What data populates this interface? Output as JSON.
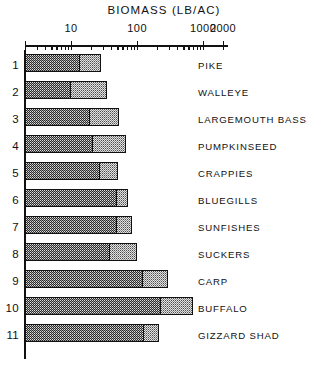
{
  "chart_data": {
    "type": "bar",
    "title": "BIOMASS (LB/AC)",
    "xlabel": "BIOMASS (LB/AC)",
    "ylabel": "",
    "orientation": "horizontal",
    "xscale": "log",
    "xlim": [
      2,
      2000
    ],
    "grid": false,
    "legend": null,
    "tick_labels": [
      "10",
      "100",
      "1000",
      "2000"
    ],
    "tick_values": [
      10,
      100,
      1000,
      2000
    ],
    "minor_tick_values": [
      3,
      4,
      5,
      6,
      7,
      8,
      9,
      20,
      30,
      40,
      50,
      60,
      70,
      80,
      90,
      200,
      300,
      400,
      500,
      600,
      700,
      800,
      900
    ],
    "categories": [
      "PIKE",
      "WALLEYE",
      "LARGEMOUTH BASS",
      "PUMPKINSEED",
      "CRAPPIES",
      "BLUEGILLS",
      "SUNFISHES",
      "SUCKERS",
      "CARP",
      "BUFFALO",
      "GIZZARD SHAD"
    ],
    "row_numbers": [
      "1",
      "2",
      "3",
      "4",
      "5",
      "6",
      "7",
      "8",
      "9",
      "10",
      "11"
    ],
    "series": [
      {
        "name": "low-range",
        "values": [
          6,
          4.3,
          8.5,
          9.5,
          12,
          22,
          22,
          18,
          56,
          105,
          58
        ]
      },
      {
        "name": "high-range",
        "values": [
          17,
          21,
          32,
          41,
          30,
          45,
          52,
          62,
          145,
          330,
          105
        ]
      }
    ],
    "rows": [
      {
        "number": "1",
        "label": "PIKE",
        "low": 6,
        "high": 17,
        "x_start": 25,
        "x_mid": 78,
        "x_end": 101
      },
      {
        "number": "2",
        "label": "WALLEYE",
        "low": 4.3,
        "high": 21,
        "x_start": 25,
        "x_mid": 69,
        "x_end": 107
      },
      {
        "number": "3",
        "label": "LARGEMOUTH BASS",
        "low": 8.5,
        "high": 32,
        "x_start": 25,
        "x_mid": 88,
        "x_end": 119
      },
      {
        "number": "4",
        "label": "PUMPKINSEED",
        "low": 9.5,
        "high": 41,
        "x_start": 25,
        "x_mid": 91,
        "x_end": 126
      },
      {
        "number": "5",
        "label": "CRAPPIES",
        "low": 12,
        "high": 30,
        "x_start": 25,
        "x_mid": 98,
        "x_end": 118
      },
      {
        "number": "6",
        "label": "BLUEGILLS",
        "low": 22,
        "high": 45,
        "x_start": 25,
        "x_mid": 115,
        "x_end": 128
      },
      {
        "number": "7",
        "label": "SUNFISHES",
        "low": 22,
        "high": 52,
        "x_start": 25,
        "x_mid": 115,
        "x_end": 132
      },
      {
        "number": "8",
        "label": "SUCKERS",
        "low": 18,
        "high": 62,
        "x_start": 25,
        "x_mid": 108,
        "x_end": 137
      },
      {
        "number": "9",
        "label": "CARP",
        "low": 56,
        "high": 145,
        "x_start": 25,
        "x_mid": 141,
        "x_end": 168
      },
      {
        "number": "10",
        "label": "BUFFALO",
        "low": 105,
        "high": 330,
        "x_start": 25,
        "x_mid": 159,
        "x_end": 193
      },
      {
        "number": "11",
        "label": "GIZZARD SHAD",
        "low": 58,
        "high": 105,
        "x_start": 25,
        "x_mid": 142,
        "x_end": 159
      }
    ]
  },
  "axis": {
    "x_origin_px": 25,
    "x_end_px": 228,
    "decade_px": 66
  }
}
